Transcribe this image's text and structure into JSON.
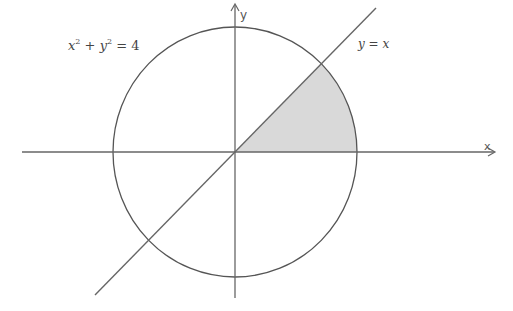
{
  "diagram": {
    "title": "",
    "circle": {
      "equation": "x² + y² = 4",
      "label_parts": {
        "x": "x",
        "sup1": "2",
        "plus": "+",
        "y": "y",
        "sup2": "2",
        "eq": "= 4"
      },
      "radius": 2
    },
    "line": {
      "equation": "y = x",
      "label": "y = x"
    },
    "axes": {
      "x_label": "x",
      "y_label": "y"
    },
    "shaded_region": {
      "description": "Region in first quadrant bounded by x-axis, line y = x, and circle x² + y² = 4",
      "fill_color": "#d9d9d9"
    },
    "colors": {
      "stroke": "#555555",
      "shade": "#d9d9d9",
      "background": "#ffffff"
    }
  }
}
